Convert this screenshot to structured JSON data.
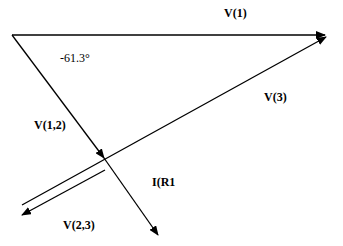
{
  "diagram": {
    "type": "phasor-diagram",
    "labels": {
      "v1": "V(1)",
      "v3": "V(3)",
      "v12": "V(1,2)",
      "v23": "V(2,3)",
      "ir1": "I(R1",
      "angle": "-61.3°"
    },
    "phasors": [
      {
        "name": "V(1)",
        "from": [
          12,
          35
        ],
        "to": [
          325,
          35
        ]
      },
      {
        "name": "V(1,2)",
        "from": [
          12,
          35
        ],
        "to": [
          104,
          158
        ]
      },
      {
        "name": "V(3)",
        "from": [
          22,
          205
        ],
        "to": [
          326,
          37
        ]
      },
      {
        "name": "V(2,3)",
        "from": [
          105,
          170
        ],
        "to": [
          22,
          214
        ]
      },
      {
        "name": "I(R1",
        "from": [
          104,
          158
        ],
        "to": [
          158,
          235
        ]
      }
    ],
    "colors": {
      "stroke": "#000000",
      "background": "#ffffff"
    }
  }
}
